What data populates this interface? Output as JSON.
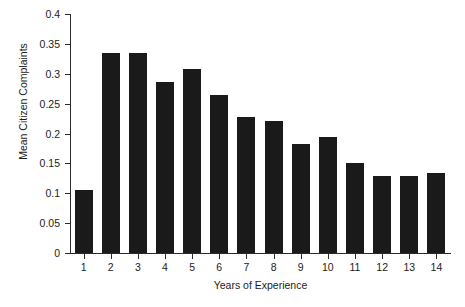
{
  "chart_data": {
    "type": "bar",
    "title": "",
    "xlabel": "Years of Experience",
    "ylabel": "Mean Citizen Complaints",
    "categories": [
      "1",
      "2",
      "3",
      "4",
      "5",
      "6",
      "7",
      "8",
      "9",
      "10",
      "11",
      "12",
      "13",
      "14"
    ],
    "values": [
      0.105,
      0.335,
      0.335,
      0.286,
      0.308,
      0.264,
      0.228,
      0.221,
      0.182,
      0.194,
      0.151,
      0.129,
      0.129,
      0.134
    ],
    "ylim": [
      0,
      0.4
    ],
    "yticks": [
      "0",
      "0.05",
      "0.1",
      "0.15",
      "0.2",
      "0.25",
      "0.3",
      "0.35",
      "0.4"
    ],
    "ytick_values": [
      0,
      0.05,
      0.1,
      0.15,
      0.2,
      0.25,
      0.3,
      0.35,
      0.4
    ],
    "grid": false,
    "legend": false,
    "bar_color": "#1a1a1a",
    "axis_color": "#2b2b2b",
    "background": "#ffffff"
  }
}
